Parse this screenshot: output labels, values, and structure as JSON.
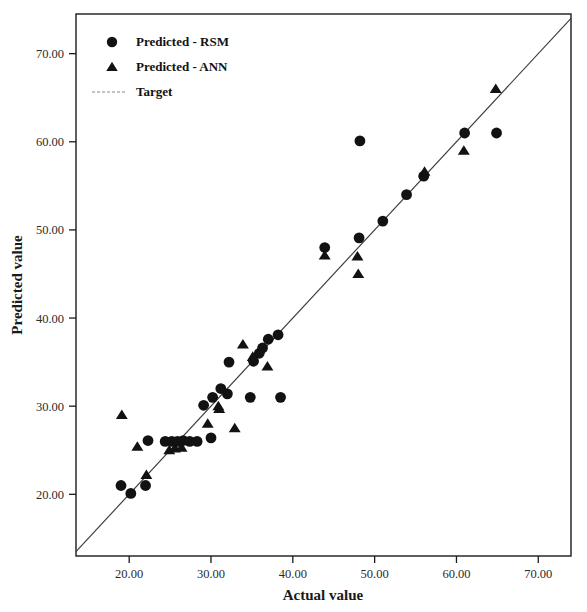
{
  "chart_data": {
    "type": "scatter",
    "title": "",
    "xlabel": "Actual value",
    "ylabel": "Predicted value",
    "xlim": [
      13.5,
      74.0
    ],
    "ylim": [
      13.0,
      74.5
    ],
    "xticks": [
      20,
      30,
      40,
      50,
      60,
      70
    ],
    "yticks": [
      20,
      30,
      40,
      50,
      60,
      70
    ],
    "xticklabels": [
      "20.00",
      "30.00",
      "40.00",
      "50.00",
      "60.00",
      "70.00"
    ],
    "yticklabels": [
      "20.00",
      "30.00",
      "40.00",
      "50.00",
      "60.00",
      "70.00"
    ],
    "grid": false,
    "legend_position": "upper-left",
    "series": [
      {
        "name": "Predicted - RSM",
        "marker": "circle",
        "color": "#121212",
        "points": [
          [
            19.0,
            21.0
          ],
          [
            20.2,
            20.1
          ],
          [
            22.0,
            21.0
          ],
          [
            22.3,
            26.1
          ],
          [
            24.4,
            26.0
          ],
          [
            25.2,
            26.0
          ],
          [
            25.9,
            26.0
          ],
          [
            26.6,
            26.1
          ],
          [
            27.4,
            26.0
          ],
          [
            28.3,
            26.0
          ],
          [
            29.1,
            30.1
          ],
          [
            30.0,
            26.4
          ],
          [
            30.2,
            31.0
          ],
          [
            31.2,
            32.0
          ],
          [
            32.0,
            31.4
          ],
          [
            32.2,
            35.0
          ],
          [
            34.8,
            31.0
          ],
          [
            35.2,
            35.1
          ],
          [
            35.9,
            36.0
          ],
          [
            36.3,
            36.6
          ],
          [
            37.0,
            37.6
          ],
          [
            38.2,
            38.1
          ],
          [
            38.5,
            31.0
          ],
          [
            43.9,
            48.0
          ],
          [
            48.1,
            49.1
          ],
          [
            48.2,
            60.1
          ],
          [
            51.0,
            51.0
          ],
          [
            53.9,
            54.0
          ],
          [
            56.0,
            56.1
          ],
          [
            61.0,
            61.0
          ],
          [
            64.9,
            61.0
          ]
        ]
      },
      {
        "name": "Predicted - ANN",
        "marker": "triangle",
        "color": "#121212",
        "points": [
          [
            19.1,
            29.0
          ],
          [
            21.0,
            25.4
          ],
          [
            22.1,
            22.2
          ],
          [
            24.9,
            25.0
          ],
          [
            25.6,
            25.2
          ],
          [
            26.4,
            25.3
          ],
          [
            29.6,
            28.0
          ],
          [
            30.9,
            30.0
          ],
          [
            31.0,
            29.7
          ],
          [
            32.9,
            27.5
          ],
          [
            33.9,
            37.0
          ],
          [
            35.1,
            35.6
          ],
          [
            36.9,
            34.5
          ],
          [
            43.9,
            47.1
          ],
          [
            47.9,
            47.0
          ],
          [
            48.0,
            45.0
          ],
          [
            56.1,
            56.6
          ],
          [
            60.9,
            59.0
          ],
          [
            64.8,
            66.0
          ]
        ]
      }
    ],
    "reference_line": {
      "name": "Target",
      "type": "identity",
      "slope": 1.0,
      "intercept": 0.0,
      "color": "#3a3a3a",
      "x_from": 13.5,
      "x_to": 74.0
    },
    "legend_entries": [
      {
        "label": "Predicted - RSM",
        "marker": "circle"
      },
      {
        "label": "Predicted - ANN",
        "marker": "triangle"
      },
      {
        "label": "Target",
        "marker": "line"
      }
    ]
  }
}
